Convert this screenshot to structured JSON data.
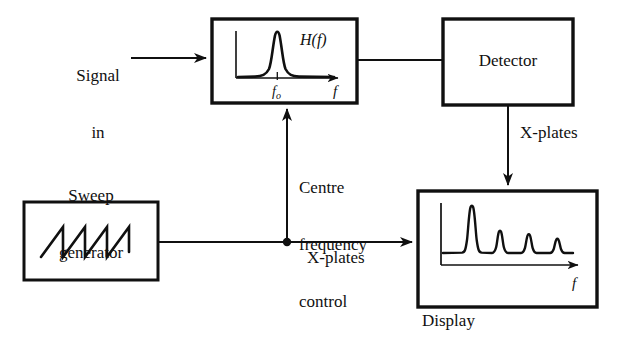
{
  "figure": {
    "type": "block-diagram",
    "background_color": "#ffffff",
    "line_color": "#101010"
  },
  "blocks": {
    "filter": {
      "name": "band-pass-filter",
      "x": 212,
      "y": 19,
      "width": 145,
      "height": 84,
      "inline_plot": {
        "type": "line",
        "curve": "resonance-peak",
        "response_label": "H(f)",
        "x_axis_label": "f",
        "x_tick_label": "fₒ",
        "tick_label_plain": "fo",
        "peak_center_fraction": 0.42,
        "peak_height_fraction": 0.88
      }
    },
    "detector": {
      "name": "detector",
      "label": "Detector",
      "x": 443,
      "y": 19,
      "width": 130,
      "height": 86
    },
    "sweep_generator": {
      "name": "sweep-generator",
      "label_line1": "Sweep",
      "label_line2": "generator",
      "x": 24,
      "y": 202,
      "width": 134,
      "height": 78,
      "inline_plot": {
        "type": "line",
        "waveform": "sawtooth",
        "teeth": 3.5
      }
    },
    "display": {
      "name": "display",
      "label": "Display",
      "x": 418,
      "y": 191,
      "width": 179,
      "height": 116,
      "inline_plot": {
        "type": "line",
        "curve": "line-spectrum",
        "x_axis_label": "f",
        "peak_count": 4,
        "peak_positions": [
          0.18,
          0.4,
          0.58,
          0.76
        ],
        "peak_heights": [
          0.92,
          0.38,
          0.3,
          0.22
        ]
      }
    }
  },
  "labels": {
    "signal_in_line1": "Signal",
    "signal_in_line2": "in",
    "centre_freq_line1": "Centre",
    "centre_freq_line2": "frequency",
    "centre_freq_line3": "control",
    "x_plates_lower": "X-plates",
    "x_plates_upper": "X-plates",
    "display_caption": "Display",
    "detector_caption": "Detector",
    "sweep_caption_line1": "Sweep",
    "sweep_caption_line2": "generator"
  },
  "connections": [
    {
      "name": "signal-in-to-filter",
      "from": "signal-input",
      "to": "band-pass-filter",
      "arrow": true,
      "orientation": "horizontal"
    },
    {
      "name": "filter-to-detector",
      "from": "band-pass-filter",
      "to": "detector",
      "arrow": false,
      "orientation": "horizontal"
    },
    {
      "name": "detector-to-display",
      "from": "detector",
      "to": "display",
      "arrow": true,
      "orientation": "vertical",
      "label": "X-plates"
    },
    {
      "name": "sweep-to-display",
      "from": "sweep-generator",
      "to": "display",
      "arrow": true,
      "orientation": "horizontal",
      "label": "X-plates"
    },
    {
      "name": "sweep-to-filter-centre-frequency",
      "from": "sweep-generator-junction",
      "to": "band-pass-filter",
      "arrow": true,
      "orientation": "vertical",
      "label": "Centre frequency control"
    }
  ],
  "junction": {
    "name": "sweep-junction-dot",
    "x": 287,
    "y": 242,
    "radius": 4
  }
}
